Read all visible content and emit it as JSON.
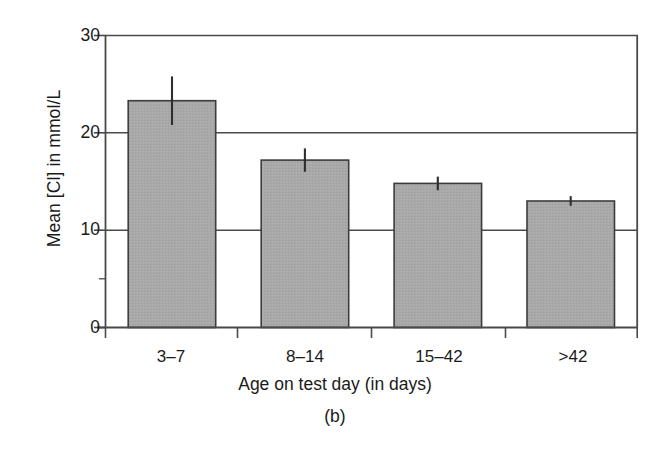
{
  "figure": {
    "panel_caption": "(b)",
    "background_color": "#ffffff"
  },
  "axes": {
    "y_title": "Mean [Cl] in mmol/L",
    "x_title": "Age on test day (in days)",
    "y_ticks": [
      "0",
      "10",
      "20",
      "30"
    ],
    "x_ticks": [
      "3–7",
      "8–14",
      "15–42",
      ">42"
    ]
  },
  "style": {
    "bar_fill": "#a8a8a8",
    "bar_stroke": "#3c3c3c",
    "axis_color": "#4a4a4a",
    "grid_color": "#4a4a4a",
    "error_color": "#2e2e2e"
  },
  "chart_data": {
    "type": "bar",
    "title": "",
    "subtitle": "",
    "panel_label": "(b)",
    "xlabel": "Age on test day (in days)",
    "ylabel": "Mean [Cl] in mmol/L",
    "categories": [
      "3–7",
      "8–14",
      "15–42",
      ">42"
    ],
    "values": [
      23.3,
      17.2,
      14.8,
      13.0
    ],
    "errors": [
      2.5,
      1.2,
      0.7,
      0.5
    ],
    "error_type": "symmetric",
    "ylim": [
      0,
      30
    ],
    "yticks": [
      0,
      10,
      20,
      30
    ],
    "grid": "horizontal",
    "legend": "none",
    "series": [
      {
        "name": "Mean [Cl]",
        "values": [
          23.3,
          17.2,
          14.8,
          13.0
        ],
        "errors": [
          2.5,
          1.2,
          0.7,
          0.5
        ]
      }
    ]
  }
}
